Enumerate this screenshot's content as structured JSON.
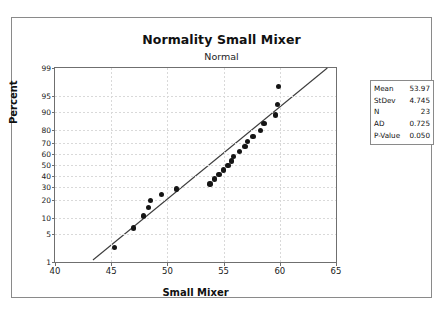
{
  "chart_data": {
    "type": "scatter",
    "title": "Normality Small Mixer",
    "subtitle": "Normal",
    "xlabel": "Small Mixer",
    "ylabel": "Percent",
    "grid": true,
    "legend": "none",
    "xlim": [
      40,
      65
    ],
    "xticks": [
      40,
      45,
      50,
      55,
      60,
      65
    ],
    "ylim": [
      1,
      99
    ],
    "yticks": [
      1,
      5,
      10,
      20,
      30,
      40,
      50,
      60,
      70,
      80,
      90,
      95,
      99
    ],
    "y_scale": "normal-probability",
    "points": [
      {
        "x": 45.3,
        "percent": 2.4
      },
      {
        "x": 47.0,
        "percent": 6.6
      },
      {
        "x": 47.9,
        "percent": 11.0
      },
      {
        "x": 48.3,
        "percent": 15.3
      },
      {
        "x": 48.5,
        "percent": 19.6
      },
      {
        "x": 49.5,
        "percent": 23.9
      },
      {
        "x": 50.8,
        "percent": 28.2
      },
      {
        "x": 53.8,
        "percent": 32.5
      },
      {
        "x": 54.2,
        "percent": 36.8
      },
      {
        "x": 54.6,
        "percent": 41.1
      },
      {
        "x": 55.0,
        "percent": 45.4
      },
      {
        "x": 55.4,
        "percent": 49.7
      },
      {
        "x": 55.7,
        "percent": 54.0
      },
      {
        "x": 55.9,
        "percent": 58.3
      },
      {
        "x": 56.4,
        "percent": 62.6
      },
      {
        "x": 56.9,
        "percent": 66.9
      },
      {
        "x": 57.1,
        "percent": 71.2
      },
      {
        "x": 57.6,
        "percent": 75.5
      },
      {
        "x": 58.3,
        "percent": 79.8
      },
      {
        "x": 58.6,
        "percent": 84.1
      },
      {
        "x": 59.6,
        "percent": 88.4
      },
      {
        "x": 59.8,
        "percent": 92.7
      },
      {
        "x": 59.9,
        "percent": 97.0
      }
    ],
    "fit_line": {
      "label": "normal fit line",
      "x_start": 43.4,
      "percent_start": 1.0,
      "x_end": 64.4,
      "percent_end": 99.0
    }
  },
  "stats": {
    "rows": [
      {
        "label": "Mean",
        "value": "53.97"
      },
      {
        "label": "StDev",
        "value": "4.745"
      },
      {
        "label": "N",
        "value": "23"
      },
      {
        "label": "AD",
        "value": "0.725"
      },
      {
        "label": "P-Value",
        "value": "0.050"
      }
    ]
  },
  "colors": {
    "marker": "#151515",
    "fit_line": "#3c3c3c",
    "grid": "#d9d9d9",
    "axis": "#6f6f6f",
    "frame": "#8a8a8a"
  }
}
